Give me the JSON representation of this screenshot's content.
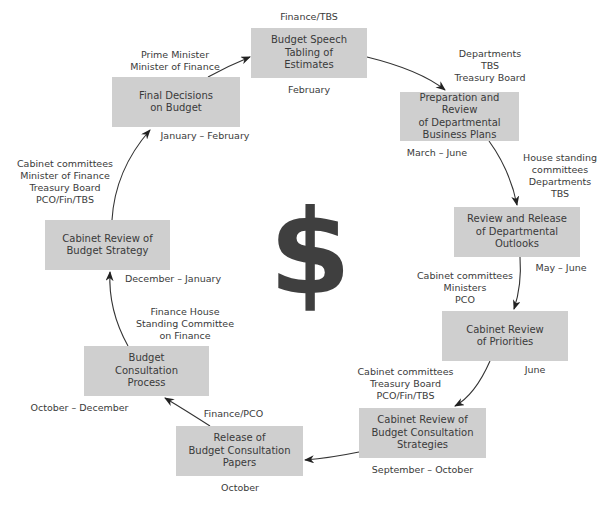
{
  "diagram": {
    "type": "cycle",
    "center_symbol": "$",
    "box_color": "#cfcfcf",
    "arrow_color": "#333333",
    "stages": [
      {
        "id": "budget-speech",
        "title": "Budget Speech\nTabling of\nEstimates",
        "actors": "Finance/TBS",
        "timing": "February"
      },
      {
        "id": "prep-review-plans",
        "title": "Preparation and Review\nof Departmental\nBusiness Plans",
        "actors": "Departments\nTBS\nTreasury Board",
        "timing": "March – June"
      },
      {
        "id": "review-release-outlooks",
        "title": "Review and Release\nof Departmental\nOutlooks",
        "actors": "House standing\ncommittees\nDepartments\nTBS",
        "timing": "May – June"
      },
      {
        "id": "cabinet-review-priorities",
        "title": "Cabinet Review\nof Priorities",
        "actors": "Cabinet committees\nMinisters\nPCO",
        "timing": "June"
      },
      {
        "id": "cabinet-review-consultation-strategies",
        "title": "Cabinet Review of\nBudget Consultation\nStrategies",
        "actors": "Cabinet committees\nTreasury Board\nPCO/Fin/TBS",
        "timing": "September – October"
      },
      {
        "id": "release-consultation-papers",
        "title": "Release of\nBudget Consultation\nPapers",
        "actors": "Finance/PCO",
        "timing": "October"
      },
      {
        "id": "budget-consultation-process",
        "title": "Budget\nConsultation\nProcess",
        "actors": "Finance House\nStanding Committee\non Finance",
        "timing": "October – December"
      },
      {
        "id": "cabinet-review-budget-strategy",
        "title": "Cabinet Review of\nBudget Strategy",
        "actors": "Cabinet committees\nMinister of Finance\nTreasury Board\nPCO/Fin/TBS",
        "timing": "December – January"
      },
      {
        "id": "final-decisions",
        "title": "Final Decisions\non Budget",
        "actors": "Prime Minister\nMinister of Finance",
        "timing": "January – February"
      }
    ]
  }
}
